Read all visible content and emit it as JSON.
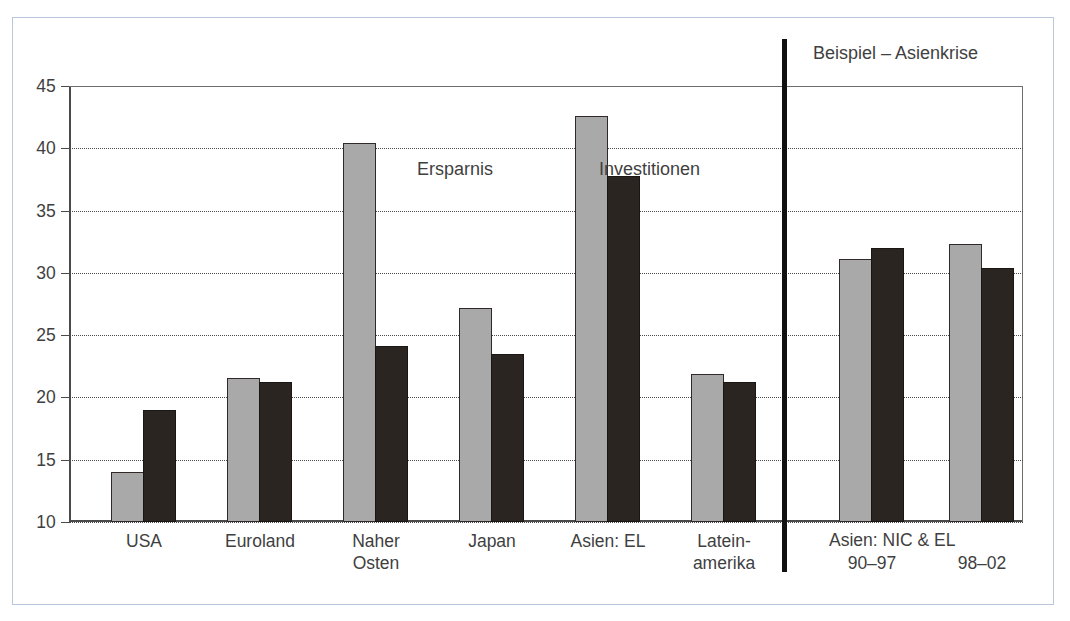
{
  "figure": {
    "divider_label": "Beispiel – Asienkrise",
    "series_labels": {
      "ersparnis": "Ersparnis",
      "investitionen": "Investitionen"
    }
  },
  "chart_data": {
    "type": "bar",
    "title": "",
    "subtitle": "",
    "xlabel": "",
    "ylabel": "",
    "ylim": [
      10,
      45
    ],
    "yticks": [
      10,
      15,
      20,
      25,
      30,
      35,
      40,
      45
    ],
    "ytick_labels": [
      "10",
      "15",
      "20",
      "25",
      "30",
      "35",
      "40",
      "45"
    ],
    "grid": true,
    "grid_style": "dotted-horizontal",
    "legend": "inline-annotations",
    "categories": [
      "USA",
      "Euroland",
      "Naher\nOsten",
      "Japan",
      "Asien: EL",
      "Latein-\namerika",
      "90–97",
      "98–02"
    ],
    "category_lines": [
      [
        "USA"
      ],
      [
        "Euroland"
      ],
      [
        "Naher",
        "Osten"
      ],
      [
        "Japan"
      ],
      [
        "Asien: EL"
      ],
      [
        "Latein-",
        "amerika"
      ],
      [
        "90–97"
      ],
      [
        "98–02"
      ]
    ],
    "group_header_right": "Asien: NIC & EL",
    "series": [
      {
        "name": "Ersparnis",
        "color": "#a9a9a9",
        "values": [
          14.0,
          21.6,
          40.4,
          27.2,
          42.6,
          21.9,
          31.1,
          32.3
        ]
      },
      {
        "name": "Investitionen",
        "color": "#2b2522",
        "values": [
          19.0,
          21.2,
          24.1,
          23.5,
          37.8,
          21.2,
          32.0,
          30.4
        ]
      }
    ],
    "annotations": [
      {
        "text": "Ersparnis",
        "kind": "series-label"
      },
      {
        "text": "Investitionen",
        "kind": "series-label"
      },
      {
        "text": "Beispiel – Asienkrise",
        "kind": "panel-label"
      }
    ],
    "colors": {
      "ersparnis": "#a9a9a9",
      "investitionen": "#2b2522",
      "axis": "#4a4a4a",
      "grid": "#4a4a4a",
      "frame": "#b9c7dd",
      "divider": "#111111",
      "text": "#3f3f3f",
      "background": "#ffffff"
    }
  }
}
